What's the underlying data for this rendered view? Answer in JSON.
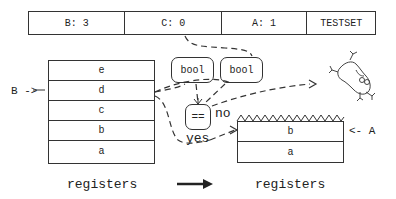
{
  "top_bar": {
    "cells": [
      {
        "label": "B: 3"
      },
      {
        "label": "C: 0"
      },
      {
        "label": "A: 1"
      },
      {
        "label": "TESTSET"
      }
    ]
  },
  "left_stack": {
    "registers": [
      "e",
      "d",
      "c",
      "b",
      "a"
    ],
    "pointer_label": "B ->",
    "pointer_target": "d",
    "caption": "registers"
  },
  "right_stack": {
    "registers": [
      "b",
      "a"
    ],
    "pointer_label": "<- A",
    "pointer_target": "b",
    "caption": "registers"
  },
  "comparator": {
    "inputs": [
      "bool",
      "bool"
    ],
    "operator": "==",
    "yes_label": "yes",
    "no_label": "no"
  },
  "icons": {
    "transition_arrow": "right-arrow-icon",
    "discarded": "tumbling-frog-icon"
  }
}
